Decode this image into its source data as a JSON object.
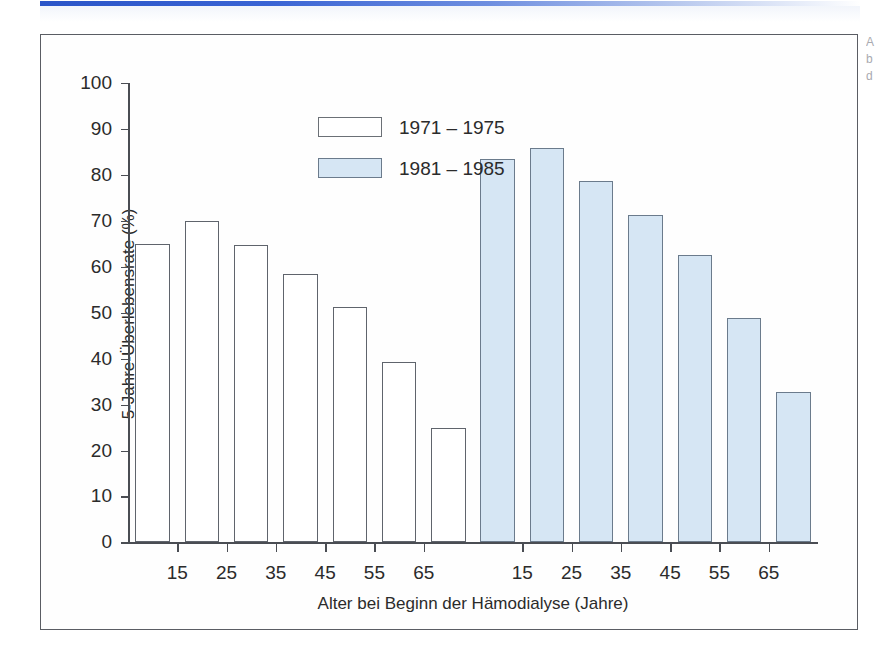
{
  "figure": {
    "frame_border_color": "#5a5d63",
    "top_rule_color": "#2b55c8",
    "caption_fragments": [
      "A",
      "b",
      "d"
    ]
  },
  "legend": {
    "position": "top-left-inside",
    "entries": [
      {
        "label": "1971 – 1975",
        "swatch": "white",
        "color": "#ffffff"
      },
      {
        "label": "1981 – 1985",
        "swatch": "blue",
        "color": "#d6e6f4"
      }
    ]
  },
  "chart_data": {
    "type": "bar",
    "title": "",
    "subtitle": "",
    "xlabel": "Alter bei Beginn der Hämodialyse (Jahre)",
    "ylabel": "5-Jahre-Überlebensrate (%)",
    "ylim": [
      0,
      100
    ],
    "ytick_labels": [
      "0",
      "10",
      "20",
      "30",
      "40",
      "50",
      "60",
      "70",
      "80",
      "90",
      "100"
    ],
    "ytick_values": [
      0,
      10,
      20,
      30,
      40,
      50,
      60,
      70,
      80,
      90,
      100
    ],
    "grid": false,
    "legend_position": "upper left",
    "categories": [
      "15",
      "25",
      "35",
      "45",
      "55",
      "65",
      ""
    ],
    "xtick_labels": [
      "15",
      "25",
      "35",
      "45",
      "55",
      "65"
    ],
    "series": [
      {
        "name": "1971 – 1975",
        "color": "#ffffff",
        "border": "#5f646c",
        "values": [
          65.0,
          70.0,
          64.8,
          58.4,
          51.3,
          39.3,
          25.0
        ]
      },
      {
        "name": "1981 – 1985",
        "color": "#d6e6f4",
        "border": "#6b7b8c",
        "values": [
          83.4,
          85.9,
          78.7,
          71.3,
          62.6,
          48.8,
          32.7
        ]
      }
    ]
  }
}
